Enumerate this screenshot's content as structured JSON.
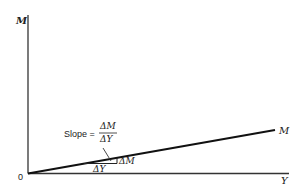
{
  "diagram": {
    "title": "",
    "y_axis_label": "M",
    "x_axis_label": "Y",
    "origin_label": "0",
    "line_label": "M",
    "slope_annotation": {
      "prefix": "Slope =",
      "numerator": "ΔM",
      "denominator": "ΔY"
    },
    "triangle_labels": {
      "rise": "ΔM",
      "run": "ΔY"
    },
    "colors": {
      "ink": "#1a1a1a",
      "axis": "#333333",
      "background": "#ffffff"
    }
  }
}
